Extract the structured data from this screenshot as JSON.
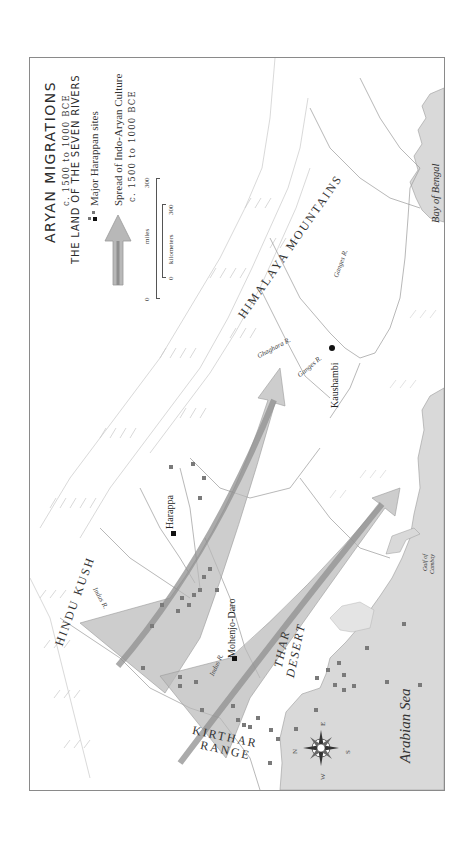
{
  "legend": {
    "title": "ARYAN MIGRATIONS",
    "date_range": "c. 1500 to 1000 BCE",
    "subtitle": "THE LAND OF THE SEVEN RIVERS",
    "items": [
      {
        "icon": "harappan-site-square-icon",
        "label": "Major Harappan sites"
      },
      {
        "icon": "migration-arrow-icon",
        "label": "Spread of Indo-Aryan Culture",
        "sublabel": "c. 1500 to 1000 BCE"
      }
    ],
    "scale": {
      "miles_label": "miles",
      "miles_start": "0",
      "miles_end": "300",
      "km_label": "kilometers",
      "km_start": "0",
      "km_end": "300"
    }
  },
  "regions": {
    "himalaya": "HIMALAYA MOUNTAINS",
    "hindu_kush": "HINDU KUSH",
    "thar_1": "THAR",
    "thar_2": "DESERT",
    "kirthar_1": "KIRTHAR",
    "kirthar_2": "RANGE"
  },
  "rivers": {
    "indus_upper": "Indus R.",
    "indus_lower": "Indus R.",
    "ganges_upper": "Ganges R.",
    "ganges_lower": "Ganges R.",
    "ghaghara": "Ghaghara R."
  },
  "cities": {
    "harappa": "Harappa",
    "mohenjo_daro": "Mohenjo-Daro",
    "kaushambi": "Kaushambi"
  },
  "water": {
    "arabian_sea": "Arabian Sea",
    "bay_of_bengal": "Bay of Bengal",
    "gulf_1": "Gulf of",
    "gulf_2": "Cambay"
  },
  "compass": {
    "n": "N",
    "e": "E",
    "s": "S",
    "w": "W"
  },
  "colors": {
    "water": "#d9d9d9",
    "arrow_fill": "#b8b8b8",
    "arrow_core": "#8f8f8f",
    "site_square": "#7a7a7a",
    "city_marker": "#111111",
    "mountain_line": "#c8c8c8",
    "river_line": "#9a9a9a"
  }
}
